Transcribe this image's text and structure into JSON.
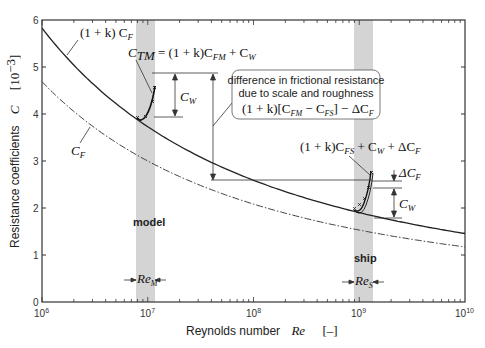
{
  "chart_data": {
    "type": "line",
    "title": "",
    "xlabel": "Reynolds number Re [–]",
    "ylabel": "Resistance coefficients C [10^-3]",
    "xscale": "log",
    "xlim": [
      1000000,
      10000000000
    ],
    "ylim": [
      0,
      6
    ],
    "x_ticks": [
      "10^6",
      "10^7",
      "10^8",
      "10^9",
      "10^10"
    ],
    "y_ticks": [
      "0",
      "1",
      "2",
      "3",
      "4",
      "5",
      "6"
    ],
    "grid": false,
    "x": [
      1000000,
      10000000,
      100000000,
      1000000000,
      10000000000
    ],
    "series": [
      {
        "name": "(1 + k) C_F",
        "style": "solid",
        "values": [
          5.83,
          3.9,
          2.6,
          1.88,
          1.38
        ]
      },
      {
        "name": "C_F",
        "style": "dash-dot",
        "values": [
          4.69,
          3.0,
          2.08,
          1.53,
          1.17
        ]
      }
    ],
    "bands": [
      {
        "name": "model",
        "label": "Re_M",
        "x_range": [
          8000000,
          12000000
        ]
      },
      {
        "name": "ship",
        "label": "Re_S",
        "x_range": [
          900000000,
          1350000000
        ]
      }
    ],
    "annotations": [
      "C_TM = (1 + k) C_FM + C_W",
      "(1 + k) C_FS + C_W + ΔC_F",
      "C_W (model)",
      "C_W (ship)",
      "ΔC_F",
      "difference in frictional resistance due to scale and roughness: (1 + k)[C_FM − C_FS] − ΔC_F"
    ]
  },
  "labels": {
    "y_axis_title": "Resistance coefficients",
    "y_axis_symbol": "C",
    "y_axis_unit": "[10",
    "y_axis_unit_exp": "−3",
    "y_axis_unit_close": "]",
    "x_axis_title": "Reynolds number",
    "x_axis_symbol": "Re",
    "x_axis_unit": "[–]",
    "curve_upper": "(1 + k) C",
    "curve_upper_sub": "F",
    "curve_lower": "C",
    "curve_lower_sub": "F",
    "ctm_main": "C",
    "ctm_sub": "TM",
    "ctm_eq": " = (1 + k)C",
    "ctm_eq_sub1": "FM",
    "ctm_eq_plus": " + C",
    "ctm_eq_sub2": "W",
    "box_line1": "difference in frictional resistance",
    "box_line2": "due to scale and roughness",
    "box_eq_a": "(1 + k)[C",
    "box_eq_sub1": "FM",
    "box_eq_b": " − C",
    "box_eq_sub2": "FS",
    "box_eq_c": "] − ΔC",
    "box_eq_sub3": "F",
    "ship_eq_a": "(1 + k)C",
    "ship_eq_sub1": "FS",
    "ship_eq_b": " + C",
    "ship_eq_sub2": "W",
    "ship_eq_c": " + ΔC",
    "ship_eq_sub3": "F",
    "cw": "C",
    "cw_sub": "W",
    "dcf": "ΔC",
    "dcf_sub": "F",
    "model_label": "model",
    "ship_label": "ship",
    "rem": "Re",
    "rem_sub": "M",
    "res": "Re",
    "res_sub": "S",
    "x_tick_base": "10",
    "x_tick_exps": [
      "6",
      "7",
      "8",
      "9",
      "10"
    ],
    "y_tick_labels": [
      "0",
      "1",
      "2",
      "3",
      "4",
      "5",
      "6"
    ]
  },
  "colors": {
    "band": "#d4d4d4",
    "line": "#222222",
    "frame": "#333333"
  }
}
